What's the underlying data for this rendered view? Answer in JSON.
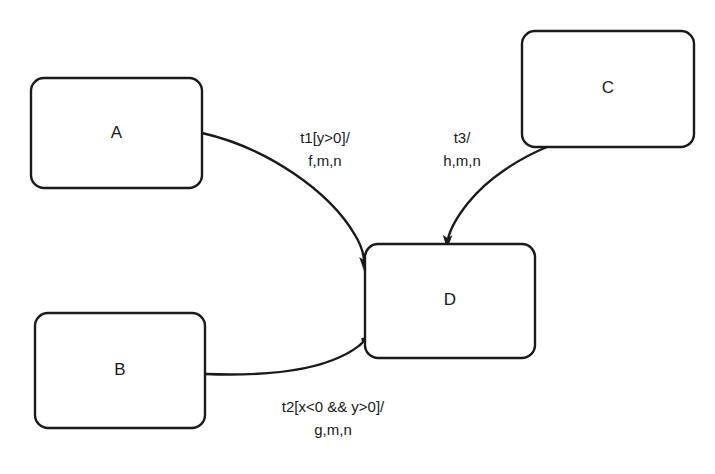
{
  "diagram": {
    "type": "uml-state-machine",
    "background_color": "#ffffff",
    "stroke_color": "#1a1a1a",
    "text_color": "#1a1a1a",
    "states": [
      {
        "id": "A",
        "label": "A",
        "x": 31,
        "y": 78,
        "width": 171,
        "height": 110,
        "rx": 13
      },
      {
        "id": "B",
        "label": "B",
        "x": 35,
        "y": 313,
        "width": 170,
        "height": 115,
        "rx": 13
      },
      {
        "id": "C",
        "label": "C",
        "x": 522,
        "y": 31,
        "width": 172,
        "height": 116,
        "rx": 13
      },
      {
        "id": "D",
        "label": "D",
        "x": 365,
        "y": 244,
        "width": 170,
        "height": 114,
        "rx": 13
      }
    ],
    "transitions": [
      {
        "id": "t1",
        "from": "A",
        "to": "D",
        "trigger": "t1",
        "guard": "[y>0]",
        "actions": "f,m,n",
        "label_line1": "t1[y>0]/",
        "label_line2": "f,m,n",
        "label_x": 325,
        "label_y1": 143,
        "label_y2": 166
      },
      {
        "id": "t3",
        "from": "C",
        "to": "D",
        "trigger": "t3",
        "guard": "",
        "actions": "h,m,n",
        "label_line1": "t3/",
        "label_line2": "h,m,n",
        "label_x": 462,
        "label_y1": 143,
        "label_y2": 166
      },
      {
        "id": "t2",
        "from": "B",
        "to": "D",
        "trigger": "t2",
        "guard": "[x<0 && y>0]",
        "actions": "g,m,n",
        "label_line1": "t2[x<0 && y>0]/",
        "label_line2": "g,m,n",
        "label_x": 333,
        "label_y1": 412,
        "label_y2": 435
      }
    ]
  }
}
